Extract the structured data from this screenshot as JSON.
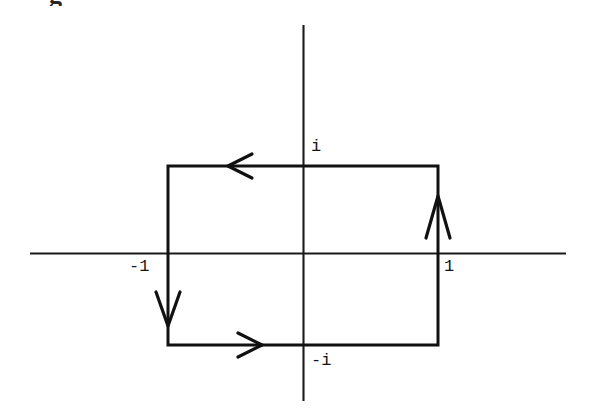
{
  "figure": {
    "kind": "complex-plane-contour-diagram",
    "background_color": "#ffffff",
    "ink_color": "#111111",
    "width": 591,
    "height": 412,
    "cropped_glyph_top": "g",
    "labels": {
      "imaginary_positive": "i",
      "imaginary_negative": "-i",
      "real_negative": "-1",
      "real_positive": "1"
    },
    "axes": {
      "real_axis": {
        "y": 253,
        "x_start": 30,
        "x_end": 566
      },
      "imaginary_axis": {
        "x": 303,
        "y_start": 25,
        "y_end": 401
      },
      "origin": {
        "x": 303,
        "y": 253
      }
    },
    "contour": {
      "shape": "rectangle",
      "orientation": "clockwise",
      "left": 168,
      "right": 438,
      "top": 166,
      "bottom": 345,
      "corners": [
        {
          "label": "-1+i",
          "x": 168,
          "y": 166
        },
        {
          "label": "1+i",
          "x": 438,
          "y": 166
        },
        {
          "label": "1-i",
          "x": 438,
          "y": 345
        },
        {
          "label": "-1-i",
          "x": 168,
          "y": 345
        }
      ]
    },
    "arrows": [
      {
        "name": "top-edge-arrow",
        "direction": "left",
        "x": 238,
        "y": 166
      },
      {
        "name": "left-edge-arrow",
        "direction": "down",
        "x": 168,
        "y": 308
      },
      {
        "name": "bottom-edge-arrow",
        "direction": "right",
        "x": 248,
        "y": 345
      },
      {
        "name": "right-edge-arrow",
        "direction": "up",
        "x": 438,
        "y": 214
      }
    ]
  }
}
